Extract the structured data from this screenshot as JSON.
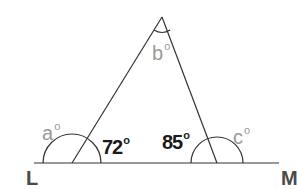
{
  "diagram": {
    "type": "triangle-on-line",
    "line": {
      "start_label": "L",
      "end_label": "M"
    },
    "angles": {
      "exterior_left": {
        "label": "a",
        "unit": "o",
        "known": false
      },
      "apex": {
        "label": "b",
        "unit": "o",
        "known": false
      },
      "exterior_right": {
        "label": "c",
        "unit": "o",
        "known": false
      },
      "interior_left": {
        "label": "72",
        "unit": "o",
        "known": true
      },
      "interior_right": {
        "label": "85",
        "unit": "o",
        "known": true
      }
    },
    "colors": {
      "line": "#333333",
      "known_label": "#1a1a1a",
      "unknown_label": "#9a9a9a",
      "point_label": "#4a4a4a"
    }
  }
}
